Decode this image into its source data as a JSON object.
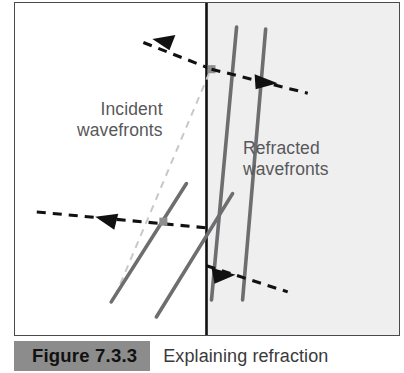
{
  "figure": {
    "caption_number": "Figure 7.3.3",
    "caption_text": "Explaining refraction",
    "labels": {
      "incident_line1": "Incident",
      "incident_line2": "wavefronts",
      "refracted_line1": "Refracted",
      "refracted_line2": "wavefronts"
    },
    "colors": {
      "frame_border": "#4a4a4a",
      "medium1_fill": "#ffffff",
      "medium2_fill": "#efefef",
      "boundary_line": "#111111",
      "wavefront_line": "#6e6e70",
      "ray_dashed": "#111111",
      "construction_dashed": "#c8c8c8",
      "label_text": "#58585a",
      "caption_box_fill": "#8c8c8c",
      "caption_number_text": "#111111",
      "caption_text": "#3a3a3a"
    },
    "geometry": {
      "boundary_x": 191,
      "incident_wavefronts": [
        {
          "x1": 96,
          "y1": 298,
          "x2": 171,
          "y2": 180
        },
        {
          "x1": 141,
          "y1": 312,
          "x2": 216,
          "y2": 189
        }
      ],
      "refracted_wavefronts": [
        {
          "x1": 196,
          "y1": 296,
          "x2": 221,
          "y2": 24
        },
        {
          "x1": 227,
          "y1": 296,
          "x2": 250,
          "y2": 26
        }
      ],
      "incident_rays": [
        {
          "x1": 196,
          "y1": 66,
          "x2": 120,
          "y2": 36,
          "arrow": "up-left"
        },
        {
          "x1": 180,
          "y1": 222,
          "x2": 18,
          "y2": 208,
          "arrow": "left"
        }
      ],
      "refracted_rays": [
        {
          "x1": 196,
          "y1": 66,
          "x2": 290,
          "y2": 88,
          "arrow": "right-down"
        },
        {
          "x1": 196,
          "y1": 264,
          "x2": 268,
          "y2": 286,
          "arrow": "right-down"
        }
      ],
      "construction_line": {
        "x1": 100,
        "y1": 292,
        "x2": 197,
        "y2": 62
      }
    }
  }
}
